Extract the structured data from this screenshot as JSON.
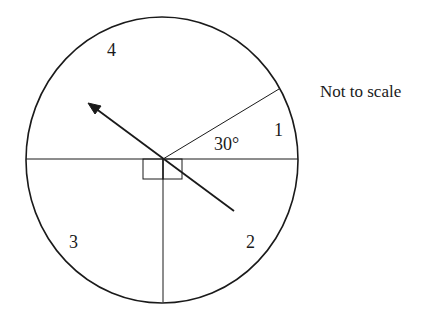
{
  "diagram": {
    "note": "Not to scale",
    "angle_label": "30°",
    "sectors": [
      {
        "id": 1,
        "label": "1"
      },
      {
        "id": 2,
        "label": "2"
      },
      {
        "id": 3,
        "label": "3"
      },
      {
        "id": 4,
        "label": "4"
      }
    ],
    "colors": {
      "stroke": "#1a1a1a",
      "background": "#ffffff"
    },
    "geometry": {
      "center": [
        163,
        159
      ],
      "radius_x": 136,
      "radius_y": 143,
      "angle_between_horizontal_and_ray_deg": 30,
      "right_angle_markers": 2,
      "arrow": {
        "from": [
          234,
          211
        ],
        "to": [
          88,
          103
        ]
      }
    }
  }
}
